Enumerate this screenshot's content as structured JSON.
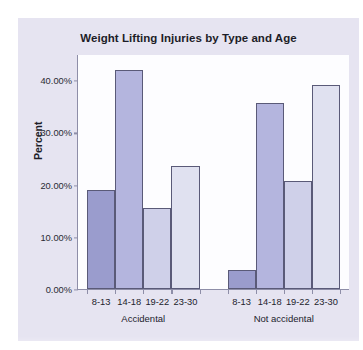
{
  "chart_data": {
    "type": "bar",
    "title": "Weight Lifting Injuries by Type and Age",
    "xlabel": "",
    "ylabel": "Percent",
    "ylim": [
      0,
      45
    ],
    "grid": false,
    "legend": "none",
    "ytick_labels": [
      "0.00%",
      "10.00%",
      "20.00%",
      "30.00%",
      "40.00%"
    ],
    "ytick_values": [
      0,
      10,
      20,
      30,
      40
    ],
    "groups": [
      "Accidental",
      "Not accidental"
    ],
    "categories": [
      "8-13",
      "14-18",
      "19-22",
      "23-30"
    ],
    "bars": [
      {
        "group": "Accidental",
        "category": "8-13",
        "value": 19.0,
        "label": "19.00%",
        "color": "#9a9ccd"
      },
      {
        "group": "Accidental",
        "category": "14-18",
        "value": 42.0,
        "label": "42.00%",
        "color": "#b4b5de"
      },
      {
        "group": "Accidental",
        "category": "19-22",
        "value": 15.5,
        "label": "15.50%",
        "color": "#cfd0e9"
      },
      {
        "group": "Accidental",
        "category": "23-30",
        "value": 23.5,
        "label": "23.50%",
        "color": "#e0e1f0"
      },
      {
        "group": "Not accidental",
        "category": "8-13",
        "value": 3.7,
        "label": "3.70%",
        "color": "#9a9ccd"
      },
      {
        "group": "Not accidental",
        "category": "14-18",
        "value": 35.6,
        "label": "35.60%",
        "color": "#b4b5de"
      },
      {
        "group": "Not accidental",
        "category": "19-22",
        "value": 20.7,
        "label": "20.70%",
        "color": "#cfd0e9"
      },
      {
        "group": "Not accidental",
        "category": "23-30",
        "value": 39.1,
        "label": "39.10%",
        "color": "#e0e1f0"
      }
    ],
    "series": [
      {
        "name": "Accidental",
        "values": [
          19.0,
          42.0,
          15.5,
          23.5
        ]
      },
      {
        "name": "Not accidental",
        "values": [
          3.7,
          35.6,
          20.7,
          39.1
        ]
      }
    ],
    "colors": {
      "bar_8_13": "#9a9ccd",
      "bar_14_18": "#b4b5de",
      "bar_19_22": "#cfd0e9",
      "bar_23_30": "#e0e1f0",
      "bar_outline": "#5a5a78",
      "axis": "#8e8ea8",
      "plot_background": "#fdfdff",
      "card_background": "#e6e4f1",
      "text": "#1d1d28"
    }
  }
}
